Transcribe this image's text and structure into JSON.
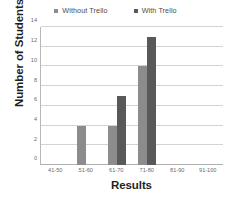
{
  "chart_data": {
    "type": "bar",
    "title": "",
    "xlabel": "Results",
    "ylabel": "Number of Students",
    "categories": [
      "41-50",
      "51-60",
      "61-70",
      "71-80",
      "81-90",
      "91-100"
    ],
    "series": [
      {
        "name": "Without Trello",
        "color": "#8c8c8c",
        "values": [
          0,
          4,
          4,
          10,
          0,
          0
        ]
      },
      {
        "name": "With Trello",
        "color": "#595959",
        "values": [
          0,
          0,
          7,
          13,
          0,
          0
        ]
      }
    ],
    "ylim": [
      0,
      14
    ],
    "yticks": [
      0,
      2,
      4,
      6,
      8,
      10,
      12,
      14
    ],
    "ytick_labels": [
      "0",
      "2",
      "4",
      "6",
      "8",
      "10",
      "12",
      "14"
    ],
    "grid": true,
    "legend_position": "top"
  },
  "legend": {
    "entries": [
      {
        "label": "Without Trello"
      },
      {
        "label": "With Trello"
      }
    ]
  },
  "colors": {
    "without_trello": "#8c8c8c",
    "with_trello": "#595959",
    "gridline": "#d3d3d3",
    "axis": "#b8b8b8",
    "tick_text": "#6b6b6b",
    "title_text": "#1f1f1f",
    "background": "#ffffff"
  }
}
